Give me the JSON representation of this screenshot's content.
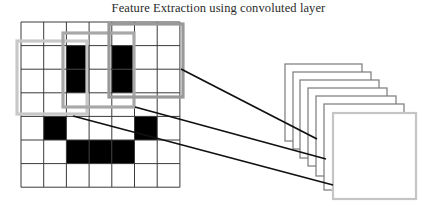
{
  "title": "Feature Extraction using convoluted layer",
  "colors": {
    "background": "#ffffff",
    "grid_line": "#3a3a3a",
    "filled_cell": "#000000",
    "connector_line": "#111111",
    "sheet_border": "#7a7a7a",
    "front_sheet_border": "#c4c4c4"
  },
  "input_grid": {
    "origin": [
      21,
      22
    ],
    "cell_width": 22.7,
    "cell_height": 23.6,
    "rows": 7,
    "cols": 7,
    "filled_cells": [
      [
        1,
        2
      ],
      [
        2,
        2
      ],
      [
        1,
        4
      ],
      [
        2,
        4
      ],
      [
        4,
        1
      ],
      [
        4,
        5
      ],
      [
        5,
        2
      ],
      [
        5,
        3
      ],
      [
        5,
        4
      ]
    ]
  },
  "filter_windows": [
    {
      "name": "filter-window-1",
      "x": 17,
      "y": 41,
      "w": 70,
      "h": 73,
      "color": "#c8c8c8"
    },
    {
      "name": "filter-window-2",
      "x": 63,
      "y": 33,
      "w": 71,
      "h": 74,
      "color": "#a8a8a8"
    },
    {
      "name": "filter-window-3",
      "x": 109,
      "y": 24,
      "w": 74,
      "h": 73,
      "color": "#999999"
    }
  ],
  "connectors": [
    {
      "name": "connector-line-1",
      "x1": 181,
      "y1": 69,
      "x2": 317,
      "y2": 139
    },
    {
      "name": "connector-line-2",
      "x1": 135,
      "y1": 107,
      "x2": 326,
      "y2": 159
    },
    {
      "name": "connector-line-3",
      "x1": 73,
      "y1": 116,
      "x2": 333,
      "y2": 185
    }
  ],
  "feature_maps": {
    "count": 7,
    "sheets": [
      {
        "x": 285,
        "y": 64,
        "w": 77,
        "h": 77
      },
      {
        "x": 293,
        "y": 72,
        "w": 78,
        "h": 77
      },
      {
        "x": 300,
        "y": 80,
        "w": 79,
        "h": 78
      },
      {
        "x": 308,
        "y": 88,
        "w": 79,
        "h": 78
      },
      {
        "x": 316,
        "y": 96,
        "w": 80,
        "h": 80
      },
      {
        "x": 324,
        "y": 104,
        "w": 80,
        "h": 86
      },
      {
        "x": 333,
        "y": 113,
        "w": 83,
        "h": 86
      }
    ]
  }
}
